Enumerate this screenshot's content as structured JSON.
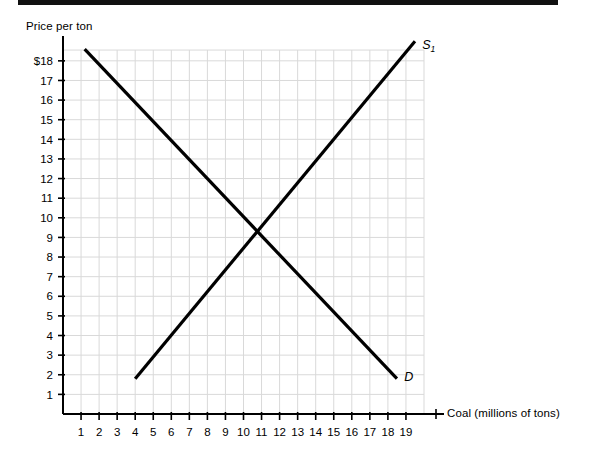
{
  "figure": {
    "name": "supply-demand-coal-graph",
    "background_color": "#ffffff",
    "ink_color": "#000000",
    "grid_color": "#d9d9d9",
    "scan_artifact_bar": true
  },
  "chart_data": {
    "type": "line",
    "title": "",
    "subtitle": "",
    "xlabel": "Coal (millions of tons)",
    "ylabel": "Price per ton",
    "xlim": [
      0,
      20
    ],
    "ylim": [
      0,
      19.8
    ],
    "grid": true,
    "grid_x_step": 1,
    "grid_y_step": 1,
    "legend": "inline-end-labels",
    "xticks": [
      1,
      2,
      3,
      4,
      5,
      6,
      7,
      8,
      9,
      10,
      11,
      12,
      13,
      14,
      15,
      16,
      17,
      18,
      19
    ],
    "xtick_labels": [
      "1",
      "2",
      "3",
      "4",
      "5",
      "6",
      "7",
      "8",
      "9",
      "10",
      "11",
      "12",
      "13",
      "14",
      "15",
      "16",
      "17",
      "18",
      "19"
    ],
    "yticks": [
      1,
      2,
      3,
      4,
      5,
      6,
      7,
      8,
      9,
      10,
      11,
      12,
      13,
      14,
      15,
      16,
      17,
      18
    ],
    "ytick_labels": [
      "1",
      "2",
      "3",
      "4",
      "5",
      "6",
      "7",
      "8",
      "9",
      "10",
      "11",
      "12",
      "13",
      "14",
      "15",
      "16",
      "17",
      "$18"
    ],
    "series": [
      {
        "name": "S1",
        "label": "S",
        "label_subscript": "1",
        "role": "supply",
        "x": [
          4.0,
          19.5
        ],
        "y": [
          1.8,
          19.0
        ],
        "color": "#000000",
        "width": 3.2
      },
      {
        "name": "D",
        "label": "D",
        "label_subscript": "",
        "role": "demand",
        "x": [
          1.2,
          18.5
        ],
        "y": [
          18.6,
          1.8
        ],
        "color": "#000000",
        "width": 3.2
      }
    ],
    "equilibrium": {
      "x": 11,
      "y": 9,
      "marked": false
    },
    "annotations": [
      {
        "text": "S",
        "subscript": "1",
        "x": 19.9,
        "y": 18.6
      },
      {
        "text": "D",
        "subscript": "",
        "x": 18.9,
        "y": 1.7
      }
    ]
  }
}
